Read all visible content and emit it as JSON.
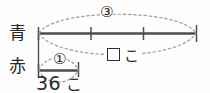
{
  "diagram": {
    "type": "tape-diagram",
    "title": "",
    "rows": [
      {
        "id": "blue",
        "label": "青",
        "label_reading": "blue",
        "multiplier": "③",
        "multiplier_value": 3,
        "segments": 3,
        "quantity": "",
        "unit": "こ",
        "unknown": true
      },
      {
        "id": "red",
        "label": "赤",
        "label_reading": "red",
        "multiplier": "①",
        "multiplier_value": 1,
        "segments": 1,
        "quantity": "36",
        "unit": "こ",
        "unknown": false
      }
    ],
    "unknown_marker": "□",
    "unknown_unit": "こ",
    "amount_value": "36",
    "amount_unit": "こ",
    "colors": {
      "line": "#4d4d4d",
      "dashed": "#8c8c8c",
      "text": "#262626",
      "background": "#fefefe"
    }
  }
}
